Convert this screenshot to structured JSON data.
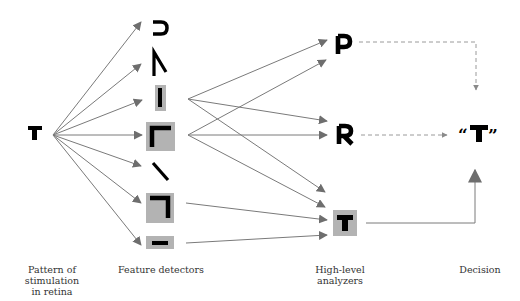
{
  "diagram": {
    "stimulus": {
      "letter": "T"
    },
    "feature_detectors": [
      {
        "id": "curve",
        "glyph": "curve-open-left",
        "highlighted": false
      },
      {
        "id": "angle",
        "glyph": "inverted-v",
        "highlighted": false
      },
      {
        "id": "vertical",
        "glyph": "vertical-line",
        "highlighted": true
      },
      {
        "id": "corner-top-left",
        "glyph": "corner-top-left",
        "highlighted": true
      },
      {
        "id": "diagonal",
        "glyph": "diagonal-backslash",
        "highlighted": false
      },
      {
        "id": "corner-top-right",
        "glyph": "corner-top-right",
        "highlighted": true
      },
      {
        "id": "horizontal",
        "glyph": "horizontal-line",
        "highlighted": true
      }
    ],
    "analyzers": [
      {
        "letter": "P",
        "highlighted": false,
        "link": "dashed"
      },
      {
        "letter": "R",
        "highlighted": false,
        "link": "dashed"
      },
      {
        "letter": "T",
        "highlighted": true,
        "link": "solid"
      }
    ],
    "decision": {
      "text": "“T”"
    },
    "captions": {
      "stage1": "Pattern of stimulation\nin retina",
      "stage1_line1": "Pattern of stimulation",
      "stage1_line2": "in retina",
      "stage2": "Feature detectors",
      "stage3_line1": "High-level",
      "stage3_line2": "analyzers",
      "stage4": "Decision"
    },
    "colors": {
      "arrow": "#6e6e6e",
      "highlight": "#b3b3b3",
      "ink": "#000000",
      "dashed": "#9a9a9a"
    }
  }
}
